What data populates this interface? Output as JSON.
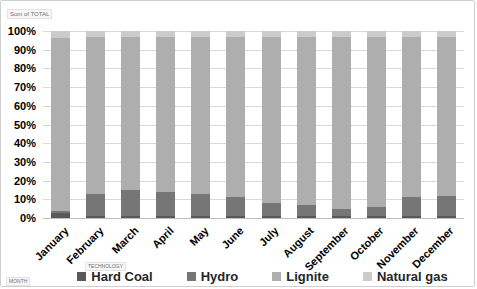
{
  "fields": {
    "values_button": "Sum of TOTAL",
    "legend_button": "TECHNOLOGY",
    "axis_button": "MONTH"
  },
  "chart_data": {
    "type": "bar",
    "stacked": true,
    "orientation": "vertical",
    "title": "",
    "xlabel": "MONTH",
    "ylabel": "Sum of TOTAL",
    "ylim": [
      0,
      100
    ],
    "y_tick_step": 10,
    "y_ticks": [
      "100%",
      "90%",
      "80%",
      "70%",
      "60%",
      "50%",
      "40%",
      "30%",
      "20%",
      "10%",
      "0%"
    ],
    "grid": true,
    "legend_position": "bottom",
    "categories": [
      "January",
      "February",
      "March",
      "April",
      "May",
      "June",
      "July",
      "August",
      "September",
      "October",
      "November",
      "December"
    ],
    "series": [
      {
        "name": "Hard Coal",
        "color": "#595959",
        "values": [
          2.5,
          1,
          1,
          1,
          1,
          1,
          1,
          1,
          1,
          1,
          1,
          1
        ]
      },
      {
        "name": "Hydro",
        "color": "#767676",
        "values": [
          1,
          12,
          14,
          13,
          12,
          10,
          7,
          6,
          4,
          5,
          10,
          11
        ]
      },
      {
        "name": "Lignite",
        "color": "#aeaeae",
        "values": [
          93,
          84,
          82,
          83,
          84,
          86,
          89,
          90,
          92,
          91,
          86,
          85
        ]
      },
      {
        "name": "Natural gas",
        "color": "#cbcbcb",
        "values": [
          3.5,
          3,
          3,
          3,
          3,
          3,
          3,
          3,
          3,
          3,
          3,
          3
        ]
      }
    ],
    "gridline_color": "#d9d9d9",
    "axis_line_color": "#bfbfbf"
  }
}
